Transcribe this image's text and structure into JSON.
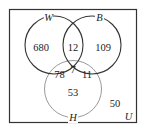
{
  "diagram": {
    "type": "venn",
    "universe_label": "U",
    "sets": [
      {
        "id": "W",
        "label": "W"
      },
      {
        "id": "B",
        "label": "B"
      },
      {
        "id": "H",
        "label": "H"
      }
    ],
    "regions": {
      "W_only": "680",
      "W_and_B_only": "12",
      "B_only": "109",
      "W_and_H_only": "78",
      "W_and_B_and_H": "7",
      "B_and_H_only": "11",
      "H_only": "53",
      "outside": "50"
    },
    "colors": {
      "border": "#333333",
      "circle_W": "#333333",
      "circle_B": "#333333",
      "circle_H": "#999999",
      "text": "#222222"
    }
  }
}
